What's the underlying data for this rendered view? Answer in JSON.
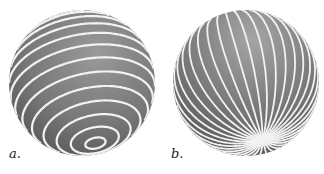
{
  "figures": [
    {
      "id": "a",
      "label": "a.",
      "description": "Sphere with concentric latitude-like circles around a tilted pole",
      "sphere_color": "#7a7a7a",
      "line_color": "#f2f2f2"
    },
    {
      "id": "b",
      "label": "b.",
      "description": "Sphere with meridian lines converging at a tilted pole",
      "sphere_color": "#7a7a7a",
      "line_color": "#f2f2f2"
    }
  ]
}
